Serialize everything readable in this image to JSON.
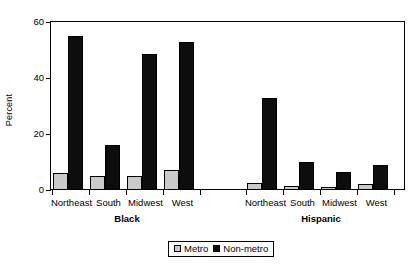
{
  "chart_data": {
    "type": "bar",
    "title": "",
    "xlabel": "",
    "ylabel": "Percent",
    "ylim": [
      0,
      60
    ],
    "yticks": [
      0,
      20,
      40,
      60
    ],
    "ytick_labels": [
      "0",
      "20",
      "40",
      "60"
    ],
    "grid": false,
    "legend_position": "bottom-center",
    "groups": [
      {
        "name": "Black",
        "categories": [
          "Northeast",
          "South",
          "Midwest",
          "West"
        ],
        "series": [
          {
            "name": "Metro",
            "values": [
              6,
              5,
              5,
              7
            ],
            "color": "#c9c9c9"
          },
          {
            "name": "Non-metro",
            "values": [
              55,
              16,
              48.5,
              53
            ],
            "color": "#0d0d0d"
          }
        ]
      },
      {
        "name": "Hispanic",
        "categories": [
          "Northeast",
          "South",
          "Midwest",
          "West"
        ],
        "series": [
          {
            "name": "Metro",
            "values": [
              2.5,
              1.5,
              1,
              2
            ],
            "color": "#c9c9c9"
          },
          {
            "name": "Non-metro",
            "values": [
              33,
              10,
              6.5,
              9
            ],
            "color": "#0d0d0d"
          }
        ]
      }
    ],
    "legend": [
      {
        "label": "Metro",
        "color": "#c9c9c9"
      },
      {
        "label": "Non-metro",
        "color": "#0d0d0d"
      }
    ]
  }
}
